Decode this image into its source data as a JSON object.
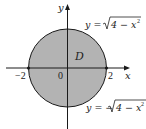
{
  "diagram": {
    "region_label": "D",
    "axes": {
      "x_label": "x",
      "y_label": "y",
      "ticks": {
        "neg": "−2",
        "origin": "0",
        "pos": "2"
      }
    },
    "curves": {
      "upper": {
        "lhs": "y = ",
        "radicand": "4 − x",
        "exp": "2"
      },
      "lower": {
        "lhs": "y = −",
        "radicand": "4 − x",
        "exp": "2"
      }
    },
    "circle": {
      "center": [
        0,
        0
      ],
      "radius": 2
    },
    "colors": {
      "fill": "#b3b3b3",
      "stroke": "#1a1a1a",
      "background": "#ffffff"
    }
  }
}
